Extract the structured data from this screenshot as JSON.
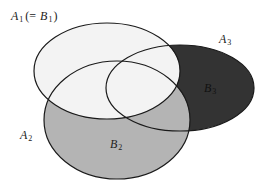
{
  "diagram": {
    "type": "venn-partition",
    "colors": {
      "background": "#ffffff",
      "light_region": "#f3f3f3",
      "gray_region": "#b4b4b4",
      "dark_region": "#333333",
      "outline": "#1a1a1a"
    },
    "sets": [
      {
        "id": "A1",
        "label_main": "A",
        "label_sub": "1",
        "note_prefix": "(= ",
        "note_main": "B",
        "note_sub": "1",
        "note_suffix": ")",
        "ellipse": {
          "cx": 107,
          "cy": 71,
          "rx": 73,
          "ry": 48
        }
      },
      {
        "id": "A2",
        "label_main": "A",
        "label_sub": "2",
        "ellipse": {
          "cx": 117,
          "cy": 120,
          "rx": 73,
          "ry": 59
        }
      },
      {
        "id": "A3",
        "label_main": "A",
        "label_sub": "3",
        "ellipse": {
          "cx": 180,
          "cy": 88,
          "rx": 74,
          "ry": 43
        }
      }
    ],
    "regions": [
      {
        "id": "B2",
        "label_main": "B",
        "label_sub": "2",
        "description": "A2 minus A1",
        "fill": "gray"
      },
      {
        "id": "B3",
        "label_main": "B",
        "label_sub": "3",
        "description": "A3 minus (A1 union A2)",
        "fill": "dark"
      }
    ]
  }
}
